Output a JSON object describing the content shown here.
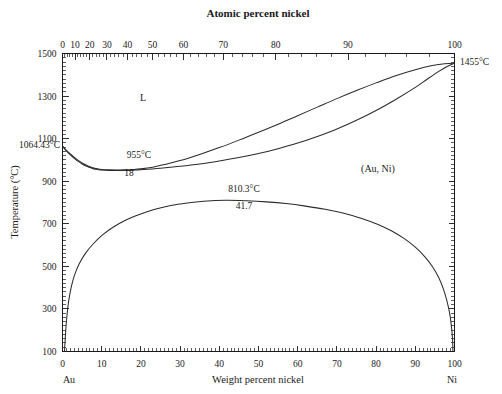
{
  "figure": {
    "title_top": "Atomic percent nickel",
    "axis_bottom_title": "Weight percent nickel",
    "axis_left_title": "Temperature (°C)",
    "corner_left_label": "Au",
    "corner_right_label": "Ni"
  },
  "annotations": {
    "liquid_region": "L",
    "solid_solution_region": "(Au, Ni)",
    "minimum_temp": "955°C",
    "minimum_comp": "18",
    "au_melting_point": "1064.43°C",
    "ni_melting_point": "1455°C",
    "miscibility_temp": "810.3°C",
    "miscibility_comp": "41.7"
  },
  "axes": {
    "left_ticks": [
      "1500",
      "1300",
      "1100",
      "900",
      "700",
      "500",
      "300",
      "100"
    ],
    "left_tick_values": [
      1500,
      1300,
      1100,
      900,
      700,
      500,
      300,
      100
    ],
    "left_range": [
      100,
      1500
    ],
    "bottom_ticks": [
      "0",
      "10",
      "20",
      "30",
      "40",
      "50",
      "60",
      "70",
      "80",
      "90",
      "100"
    ],
    "bottom_tick_values": [
      0,
      10,
      20,
      30,
      40,
      50,
      60,
      70,
      80,
      90,
      100
    ],
    "bottom_range": [
      0,
      100
    ],
    "top_ticks": [
      "0",
      "10",
      "20",
      "30",
      "40",
      "50",
      "60",
      "70",
      "80",
      "90",
      "100"
    ],
    "top_tick_values": [
      0,
      10,
      20,
      30,
      40,
      50,
      60,
      70,
      80,
      90,
      100
    ],
    "top_tick_weight_positions": [
      0,
      3.07,
      6.29,
      9.68,
      13.24,
      17.0,
      20.97,
      25.16,
      29.6,
      34.3,
      39.3,
      44.6,
      50.3,
      56.4,
      62.9,
      69.9,
      77.3,
      85.3,
      93.8,
      100
    ]
  },
  "colors": {
    "line": "#2b2b2b",
    "axis": "#1a1a1a",
    "background": "#ffffff",
    "text": "#1a1a1a"
  },
  "chart_data": {
    "type": "line",
    "xlabel": "Weight percent nickel",
    "ylabel": "Temperature (°C)",
    "xlim": [
      0,
      100
    ],
    "ylim": [
      100,
      1500
    ],
    "grid": false,
    "legend": null,
    "top_axis": {
      "label": "Atomic percent nickel",
      "ticks": [
        0,
        10,
        20,
        30,
        40,
        50,
        60,
        70,
        80,
        90,
        100
      ]
    },
    "key_points": [
      {
        "name": "Au melting point",
        "x": 0,
        "y": 1064.43,
        "label": "1064.43°C"
      },
      {
        "name": "Ni melting point",
        "x": 100,
        "y": 1455,
        "label": "1455°C"
      },
      {
        "name": "Liquidus/solidus minimum",
        "x": 18,
        "y": 955,
        "label": "955°C"
      },
      {
        "name": "Miscibility gap critical point",
        "x": 41.7,
        "y": 810.3,
        "label": "810.3°C"
      }
    ],
    "series": [
      {
        "name": "liquidus",
        "points": [
          [
            0,
            1064.43
          ],
          [
            1,
            1045
          ],
          [
            2,
            1028
          ],
          [
            3,
            1012
          ],
          [
            4,
            998
          ],
          [
            5,
            986
          ],
          [
            6,
            976
          ],
          [
            7,
            968
          ],
          [
            8,
            962
          ],
          [
            9,
            958
          ],
          [
            10,
            955.5
          ],
          [
            12,
            953.5
          ],
          [
            14,
            953
          ],
          [
            16,
            953.5
          ],
          [
            18,
            955
          ],
          [
            20,
            958
          ],
          [
            23,
            966
          ],
          [
            26,
            978
          ],
          [
            30,
            997
          ],
          [
            35,
            1026
          ],
          [
            40,
            1058
          ],
          [
            45,
            1093
          ],
          [
            50,
            1130
          ],
          [
            55,
            1168
          ],
          [
            60,
            1208
          ],
          [
            65,
            1248
          ],
          [
            70,
            1288
          ],
          [
            75,
            1326
          ],
          [
            80,
            1362
          ],
          [
            85,
            1396
          ],
          [
            90,
            1424
          ],
          [
            94,
            1442
          ],
          [
            97,
            1451
          ],
          [
            100,
            1455
          ]
        ]
      },
      {
        "name": "solidus",
        "points": [
          [
            0,
            1064.43
          ],
          [
            1,
            1043
          ],
          [
            2,
            1024
          ],
          [
            3,
            1007
          ],
          [
            4,
            993
          ],
          [
            5,
            981
          ],
          [
            6,
            971
          ],
          [
            7,
            964
          ],
          [
            8,
            958
          ],
          [
            9,
            955
          ],
          [
            10,
            952.5
          ],
          [
            12,
            950.5
          ],
          [
            14,
            950
          ],
          [
            16,
            950.5
          ],
          [
            18,
            952
          ],
          [
            20,
            954
          ],
          [
            25,
            961
          ],
          [
            30,
            970
          ],
          [
            35,
            981
          ],
          [
            40,
            995
          ],
          [
            45,
            1011
          ],
          [
            50,
            1030
          ],
          [
            55,
            1053
          ],
          [
            60,
            1079
          ],
          [
            65,
            1110
          ],
          [
            70,
            1145
          ],
          [
            75,
            1186
          ],
          [
            80,
            1232
          ],
          [
            85,
            1284
          ],
          [
            90,
            1341
          ],
          [
            93,
            1379
          ],
          [
            96,
            1416
          ],
          [
            98,
            1438
          ],
          [
            100,
            1455
          ]
        ]
      },
      {
        "name": "miscibility gap (solvus)",
        "points": [
          [
            0.5,
            100
          ],
          [
            0.7,
            160
          ],
          [
            0.9,
            220
          ],
          [
            1.2,
            280
          ],
          [
            1.6,
            340
          ],
          [
            2.2,
            400
          ],
          [
            3.0,
            455
          ],
          [
            4.2,
            510
          ],
          [
            5.8,
            560
          ],
          [
            7.8,
            605
          ],
          [
            10.2,
            648
          ],
          [
            13.0,
            685
          ],
          [
            16.2,
            718
          ],
          [
            19.8,
            745
          ],
          [
            23.6,
            768
          ],
          [
            27.6,
            786
          ],
          [
            31.8,
            798
          ],
          [
            36.0,
            806
          ],
          [
            41.7,
            810.3
          ],
          [
            47.0,
            808
          ],
          [
            52.0,
            803
          ],
          [
            57.0,
            795
          ],
          [
            62.0,
            783
          ],
          [
            67.0,
            768
          ],
          [
            72.0,
            748
          ],
          [
            76.5,
            724
          ],
          [
            80.5,
            697
          ],
          [
            84.0,
            666
          ],
          [
            87.2,
            630
          ],
          [
            90.0,
            590
          ],
          [
            92.4,
            546
          ],
          [
            94.4,
            498
          ],
          [
            96.0,
            446
          ],
          [
            97.2,
            392
          ],
          [
            98.1,
            335
          ],
          [
            98.8,
            276
          ],
          [
            99.2,
            220
          ],
          [
            99.5,
            160
          ],
          [
            99.6,
            100
          ]
        ]
      }
    ]
  }
}
